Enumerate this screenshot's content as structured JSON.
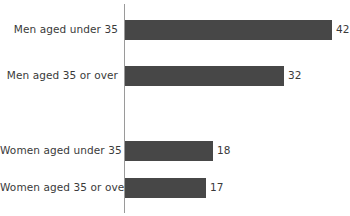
{
  "chart_data": {
    "type": "bar",
    "orientation": "horizontal",
    "title": "",
    "xlabel": "",
    "ylabel": "",
    "categories": [
      "Men aged under 35",
      "Men aged 35 or over",
      "Women aged under 35",
      "Women aged 35 or over"
    ],
    "values": [
      42,
      32,
      18,
      17
    ],
    "data_labels": [
      "42",
      "32",
      "18",
      "17"
    ],
    "xlim": [
      0,
      46
    ],
    "grid": false,
    "legend": false,
    "bar_color": "#474747",
    "axis_color": "#9a9a9a",
    "text_color": "#3a3a3a",
    "background": "#ffffff",
    "bars": [
      {
        "category": "Men aged under 35",
        "value": 42,
        "label": "42",
        "top": 20,
        "height": 20,
        "width": 207
      },
      {
        "category": "Men aged 35 or over",
        "value": 32,
        "label": "32",
        "top": 66,
        "height": 20,
        "width": 159
      },
      {
        "category": "Women aged under 35",
        "value": 18,
        "label": "18",
        "top": 141,
        "height": 20,
        "width": 88
      },
      {
        "category": "Women aged 35 or over",
        "value": 17,
        "label": "17",
        "top": 178,
        "height": 20,
        "width": 81
      }
    ]
  },
  "chart": {
    "title_remnant": ""
  }
}
